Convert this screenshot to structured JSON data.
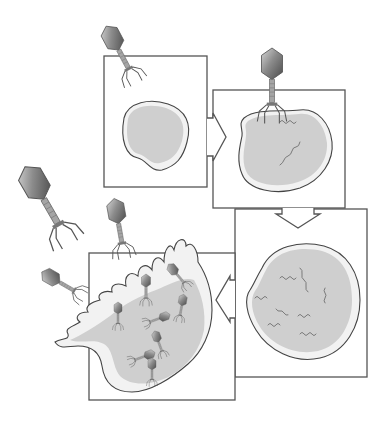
{
  "figure": {
    "panels": [
      {
        "id": 1,
        "name": "attachment",
        "description": "Phage approaches bacterial cell"
      },
      {
        "id": 2,
        "name": "injection",
        "description": "Phage attaches and injects viral DNA into cell"
      },
      {
        "id": 3,
        "name": "replication",
        "description": "Viral DNA replicates inside the cell"
      },
      {
        "id": 4,
        "name": "lysis",
        "description": "Cell bursts releasing new phages"
      }
    ],
    "arrows": [
      {
        "from": 1,
        "to": 2,
        "direction": "right"
      },
      {
        "from": 2,
        "to": 3,
        "direction": "down"
      },
      {
        "from": 3,
        "to": 4,
        "direction": "left"
      }
    ],
    "colors": {
      "outline": "#555555",
      "cell_membrane": "#f2f2f2",
      "cytoplasm": "#cfcfcf",
      "phage_head": "#8a8a8a",
      "dna": "#7a7a7a"
    }
  }
}
